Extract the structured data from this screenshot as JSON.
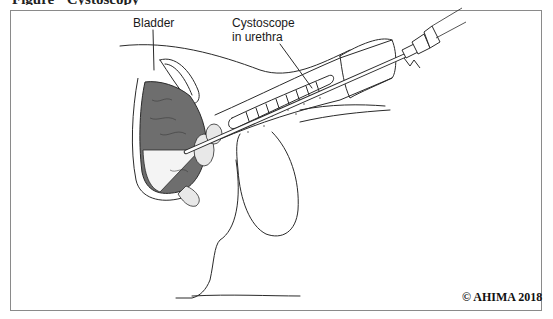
{
  "figure": {
    "title_partial": "Figure · Cystoscopy · · ·",
    "labels": {
      "bladder": "Bladder",
      "cystoscope_line1": "Cystoscope",
      "cystoscope_line2": "in urethra"
    },
    "copyright": "© AHIMA 2018",
    "colors": {
      "frame": "#8a8a8a",
      "line": "#2a2a2a",
      "bladder_fill": "#6e6e6e",
      "background": "#ffffff"
    }
  }
}
